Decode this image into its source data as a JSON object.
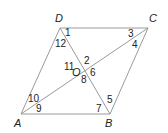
{
  "diagram": {
    "type": "parallelogram-with-diagonals",
    "line_color": "#9a9a9a",
    "text_color": "#222222",
    "vertices": [
      {
        "name": "D",
        "x": 60,
        "y": 28,
        "label_x": 55,
        "label_y": 22
      },
      {
        "name": "C",
        "x": 148,
        "y": 28,
        "label_x": 149,
        "label_y": 22
      },
      {
        "name": "A",
        "x": 21,
        "y": 114,
        "label_x": 14,
        "label_y": 127
      },
      {
        "name": "B",
        "x": 110,
        "y": 114,
        "label_x": 105,
        "label_y": 127
      }
    ],
    "center": {
      "name": "O",
      "x": 84,
      "y": 71,
      "label_x": 72,
      "label_y": 76
    },
    "angles": [
      {
        "label": "1",
        "x": 65,
        "y": 36
      },
      {
        "label": "2",
        "x": 84,
        "y": 64
      },
      {
        "label": "3",
        "x": 128,
        "y": 37
      },
      {
        "label": "4",
        "x": 132,
        "y": 48
      },
      {
        "label": "5",
        "x": 107,
        "y": 103
      },
      {
        "label": "6",
        "x": 90,
        "y": 76
      },
      {
        "label": "7",
        "x": 96,
        "y": 112
      },
      {
        "label": "8",
        "x": 81,
        "y": 83
      },
      {
        "label": "9",
        "x": 36,
        "y": 112
      },
      {
        "label": "10",
        "x": 28,
        "y": 102
      },
      {
        "label": "11",
        "x": 64,
        "y": 70
      },
      {
        "label": "12",
        "x": 55,
        "y": 47
      }
    ]
  }
}
